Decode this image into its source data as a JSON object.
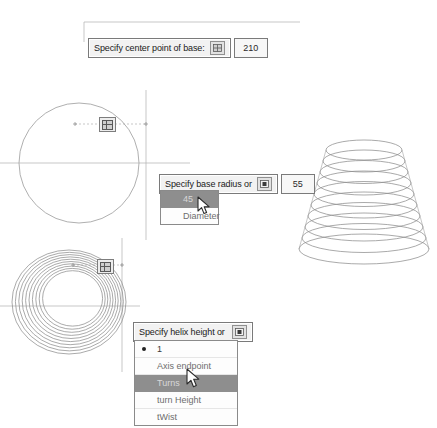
{
  "app": {
    "context": "cad-helix-command-sequence"
  },
  "tooltips": [
    {
      "id": "center-point",
      "prompt": "Specify center point of base:",
      "icon": "snap-grid-icon",
      "value": "210"
    },
    {
      "id": "base-radius",
      "prompt": "Specify base radius or",
      "icon": "dropdown-expand-icon",
      "value": "55"
    },
    {
      "id": "helix-height",
      "prompt": "Specify helix height or",
      "icon": "dropdown-expand-icon",
      "value": ""
    }
  ],
  "menus": [
    {
      "id": "base-radius-options",
      "items": [
        {
          "label": "45",
          "selected": true,
          "bullet": false
        },
        {
          "label": "Diameter",
          "selected": false,
          "bullet": false
        }
      ]
    },
    {
      "id": "helix-height-options",
      "items": [
        {
          "label": "1",
          "selected": false,
          "bullet": true
        },
        {
          "label": "Axis endpoint",
          "selected": false,
          "bullet": false
        },
        {
          "label": "Turns",
          "selected": true,
          "bullet": false
        },
        {
          "label": "turn Height",
          "selected": false,
          "bullet": false
        },
        {
          "label": "tWist",
          "selected": false,
          "bullet": false
        }
      ]
    }
  ],
  "drawings": [
    {
      "id": "base-circle",
      "name": "base-circle-with-crosshair"
    },
    {
      "id": "top-spiral",
      "name": "top-view-helix-spiral"
    },
    {
      "id": "helix-3d",
      "name": "three-d-helix-coil"
    }
  ],
  "markers": [
    {
      "id": "marker-1",
      "name": "osnap-marker-circle"
    },
    {
      "id": "marker-2",
      "name": "osnap-marker-spiral"
    }
  ],
  "cursors": [
    {
      "id": "cursor-1",
      "name": "pointer-on-diameter-option"
    },
    {
      "id": "cursor-2",
      "name": "pointer-on-turns-option"
    }
  ],
  "colors": {
    "line": "#8a8a8a",
    "tooltip_bg": "#f2f2f2",
    "tooltip_border": "#7a7a7a",
    "menu_highlight": "#8e8e8e",
    "menu_text": "#6e6e6e"
  }
}
